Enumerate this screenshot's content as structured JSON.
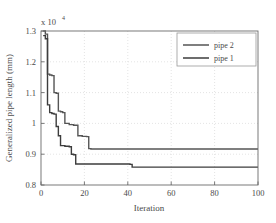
{
  "chart_data": {
    "type": "line",
    "title": "",
    "xlabel": "Iteration",
    "ylabel": "Generalized pipe length (mm)",
    "y_multiplier_label": "x 10",
    "y_multiplier_exponent": "4",
    "xlim": [
      0,
      100
    ],
    "ylim": [
      0.8,
      1.3
    ],
    "xticks": [
      0,
      20,
      40,
      60,
      80,
      100
    ],
    "xticklabels": [
      "0",
      "20",
      "40",
      "60",
      "80",
      "100"
    ],
    "yticks": [
      0.8,
      0.9,
      1.0,
      1.1,
      1.2,
      1.3
    ],
    "yticklabels": [
      "0.8",
      "0.9",
      "1",
      "1.1",
      "1.2",
      "1.3"
    ],
    "grid": true,
    "grid_style": "dotted",
    "grid_color": "#d9d9d9",
    "legend_position": "top-right",
    "legend_entries": [
      "pipe 2",
      "pipe 1"
    ],
    "series": [
      {
        "name": "pipe 2",
        "color": "#555555",
        "line_width": 1.4,
        "step": "post",
        "x": [
          1,
          2,
          3,
          4,
          5,
          6,
          7,
          8,
          9,
          10,
          11,
          13,
          15,
          17,
          19,
          21,
          22,
          23,
          100
        ],
        "y": [
          1.3,
          1.29,
          1.16,
          1.157,
          1.155,
          1.1,
          1.098,
          1.04,
          1.038,
          1.035,
          1.0,
          0.996,
          0.994,
          0.96,
          0.958,
          0.957,
          0.918,
          0.917,
          0.917
        ]
      },
      {
        "name": "pipe 1",
        "color": "#3d3d3d",
        "line_width": 1.4,
        "step": "post",
        "x": [
          1,
          2,
          3,
          4,
          5,
          6,
          7,
          8,
          9,
          11,
          13,
          14,
          15,
          16,
          41,
          42,
          43,
          100
        ],
        "y": [
          1.285,
          1.275,
          1.06,
          1.035,
          1.032,
          1.03,
          0.99,
          0.96,
          0.928,
          0.926,
          0.924,
          0.9,
          0.898,
          0.868,
          0.867,
          0.858,
          0.858,
          0.858
        ]
      }
    ]
  },
  "axes": {
    "exp_prefix": "x 10",
    "exp_power": "4"
  }
}
